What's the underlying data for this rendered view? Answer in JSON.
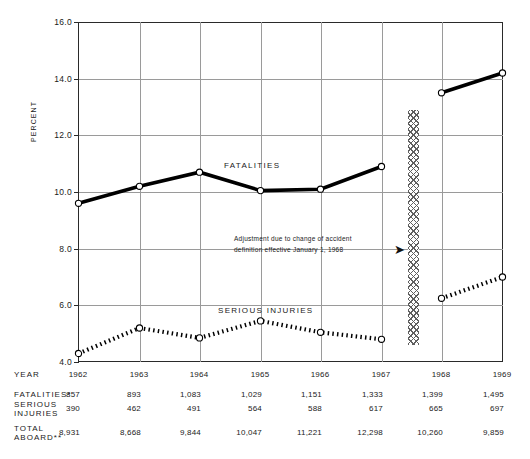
{
  "chart_data": {
    "type": "line",
    "title": "",
    "xlabel": "",
    "ylabel": "PERCENT",
    "ylim": [
      4.0,
      16.0
    ],
    "yticks": [
      "4.0",
      "6.0",
      "8.0",
      "10.0",
      "12.0",
      "14.0",
      "16.0"
    ],
    "grid": true,
    "categories": [
      "1962",
      "1963",
      "1964",
      "1965",
      "1966",
      "1967",
      "1968",
      "1969"
    ],
    "series": [
      {
        "name": "FATALITIES",
        "style": "solid",
        "values": [
          9.6,
          10.2,
          10.7,
          10.05,
          10.1,
          10.9,
          13.5,
          14.2
        ],
        "break_after_index": 5
      },
      {
        "name": "SERIOUS INJURIES",
        "style": "dotted",
        "values": [
          4.3,
          5.2,
          4.85,
          5.45,
          5.05,
          4.8,
          6.25,
          7.0
        ],
        "break_after_index": 5
      }
    ],
    "annotations": [
      {
        "name": "definition-change-note",
        "line1": "Adjustment due to change of accident",
        "line2": "definition effective January 1, 1968",
        "arrow": "➤"
      }
    ],
    "band": {
      "name": "discontinuity-band",
      "label": "hatched break between 1967 and 1968"
    }
  },
  "labels": {
    "fatalities": "FATALITIES",
    "serious_injuries": "SERIOUS INJURIES",
    "percent_axis": "PERCENT"
  },
  "table": {
    "rows": [
      {
        "label": "YEAR",
        "values": [
          "1962",
          "1963",
          "1964",
          "1965",
          "1966",
          "1967",
          "1968",
          "1969"
        ]
      },
      {
        "label": "FATALITIES*",
        "values": [
          "857",
          "893",
          "1,083",
          "1,029",
          "1,151",
          "1,333",
          "1,399",
          "1,495"
        ]
      },
      {
        "label": "SERIOUS\nINJURIES",
        "values": [
          "390",
          "462",
          "491",
          "564",
          "588",
          "617",
          "665",
          "697"
        ]
      },
      {
        "label": "TOTAL\nABOARD**",
        "values": [
          "8,931",
          "8,668",
          "9,844",
          "10,047",
          "11,221",
          "12,298",
          "10,260",
          "9,859"
        ]
      }
    ]
  }
}
